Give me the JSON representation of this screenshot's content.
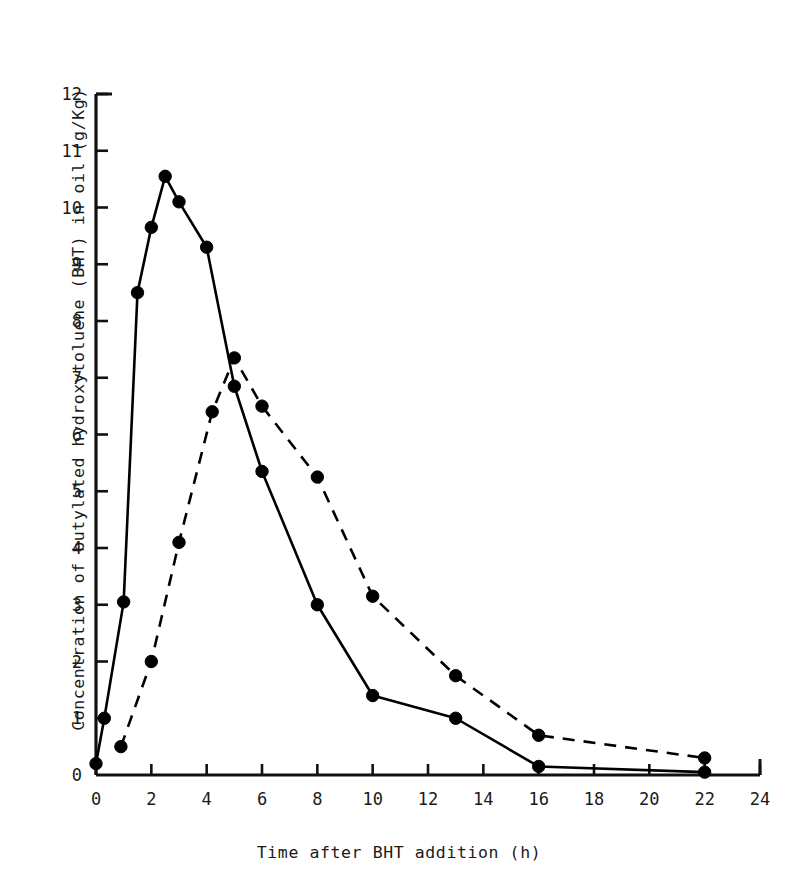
{
  "chart_data": {
    "type": "line",
    "title": "",
    "xlabel": "Time after BHT addition (h)",
    "ylabel": "Concentration of butylated hydroxytoluene (BHT) in oil (g/Kg)",
    "xlim": [
      0,
      24
    ],
    "ylim": [
      0,
      12
    ],
    "xticks": [
      0,
      2,
      4,
      6,
      8,
      10,
      12,
      14,
      16,
      18,
      20,
      22,
      24
    ],
    "yticks": [
      0,
      1,
      2,
      3,
      4,
      5,
      6,
      7,
      8,
      9,
      10,
      11,
      12
    ],
    "grid": false,
    "legend": "none",
    "marker": "filled-circle",
    "series": [
      {
        "name": "series-solid",
        "style": "solid",
        "color": "#000000",
        "points": [
          [
            0.0,
            0.2
          ],
          [
            0.3,
            1.0
          ],
          [
            1.0,
            3.05
          ],
          [
            1.5,
            8.5
          ],
          [
            2.0,
            9.65
          ],
          [
            2.5,
            10.55
          ],
          [
            3.0,
            10.1
          ],
          [
            4.0,
            9.3
          ],
          [
            5.0,
            6.85
          ],
          [
            6.0,
            5.35
          ],
          [
            8.0,
            3.0
          ],
          [
            10.0,
            1.4
          ],
          [
            13.0,
            1.0
          ],
          [
            16.0,
            0.15
          ],
          [
            22.0,
            0.05
          ]
        ]
      },
      {
        "name": "series-dashed",
        "style": "dashed",
        "color": "#000000",
        "points": [
          [
            0.9,
            0.5
          ],
          [
            2.0,
            2.0
          ],
          [
            3.0,
            4.1
          ],
          [
            4.2,
            6.4
          ],
          [
            5.0,
            7.35
          ],
          [
            6.0,
            6.5
          ],
          [
            8.0,
            5.25
          ],
          [
            10.0,
            3.15
          ],
          [
            13.0,
            1.75
          ],
          [
            16.0,
            0.7
          ],
          [
            22.0,
            0.3
          ]
        ]
      }
    ]
  },
  "axes": {
    "x_tick_labels": [
      "0",
      "2",
      "4",
      "6",
      "8",
      "10",
      "12",
      "14",
      "16",
      "18",
      "20",
      "22",
      "24"
    ],
    "y_tick_labels": [
      "0",
      "1",
      "2",
      "3",
      "4",
      "5",
      "6",
      "7",
      "8",
      "9",
      "10",
      "11",
      "12"
    ]
  }
}
